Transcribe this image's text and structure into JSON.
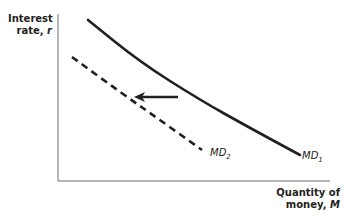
{
  "chart_data": {
    "type": "line",
    "title": "",
    "xlabel": "Quantity of money, M",
    "ylabel": "Interest rate, r",
    "xlabel_lines": [
      "Quantity of",
      "money, M"
    ],
    "ylabel_lines": [
      "Interest",
      "rate, r"
    ],
    "grid": false,
    "series": [
      {
        "name": "MD1",
        "label_main": "MD",
        "label_sub": "1",
        "style": "solid",
        "color": "#231f20",
        "points": [
          [
            88,
            20
          ],
          [
            140,
            62
          ],
          [
            200,
            100
          ],
          [
            250,
            128
          ],
          [
            300,
            155
          ]
        ]
      },
      {
        "name": "MD2",
        "label_main": "MD",
        "label_sub": "2",
        "style": "dashed",
        "color": "#231f20",
        "points": [
          [
            72,
            57
          ],
          [
            120,
            92
          ],
          [
            160,
            120
          ],
          [
            202,
            150
          ]
        ]
      }
    ],
    "annotations": [
      {
        "type": "arrow",
        "direction": "left",
        "from": [
          178,
          97
        ],
        "to": [
          134,
          97
        ],
        "meaning": "leftward shift of money demand from MD1 to MD2"
      }
    ],
    "axes": {
      "origin": [
        58,
        181
      ],
      "x_end": 330,
      "y_end": 14
    }
  }
}
